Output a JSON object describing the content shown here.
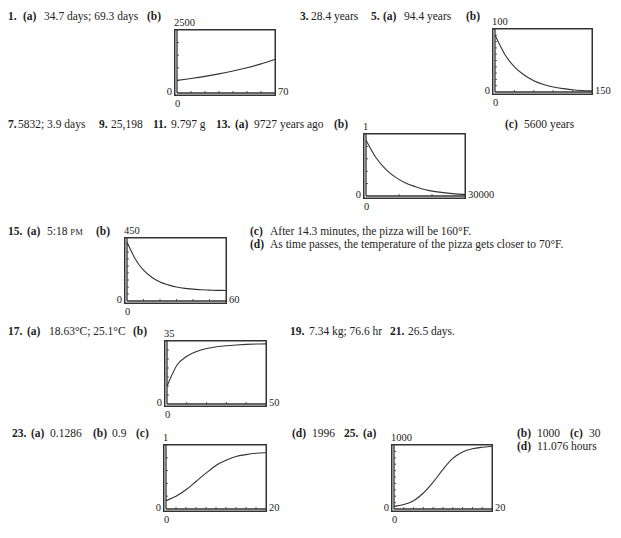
{
  "answers": {
    "a1": {
      "num": "1.",
      "a_lbl": "(a)",
      "a_val": "34.7 days; 69.3 days",
      "b_lbl": "(b)"
    },
    "a3": {
      "num": "3.",
      "val": "28.4 years"
    },
    "a5": {
      "num": "5.",
      "a_lbl": "(a)",
      "a_val": "94.4 years",
      "b_lbl": "(b)"
    },
    "a7": {
      "num": "7.",
      "val": "5832; 3.9 days"
    },
    "a9": {
      "num": "9.",
      "val": "25,198"
    },
    "a11": {
      "num": "11.",
      "val": "9.797 g"
    },
    "a13": {
      "num": "13.",
      "a_lbl": "(a)",
      "a_val": "9727 years ago",
      "b_lbl": "(b)",
      "c_lbl": "(c)",
      "c_val": "5600 years"
    },
    "a15": {
      "num": "15.",
      "a_lbl": "(a)",
      "a_val": "5:18",
      "a_suffix": "PM",
      "b_lbl": "(b)",
      "c_lbl": "(c)",
      "c_val": "After 14.3 minutes, the pizza will be 160°F.",
      "d_lbl": "(d)",
      "d_val": "As time passes, the temperature of the pizza gets closer to 70°F."
    },
    "a17": {
      "num": "17.",
      "a_lbl": "(a)",
      "a_val": "18.63°C; 25.1°C",
      "b_lbl": "(b)"
    },
    "a19": {
      "num": "19.",
      "val": "7.34 kg; 76.6 hr"
    },
    "a21": {
      "num": "21.",
      "val": "26.5 days."
    },
    "a23": {
      "num": "23.",
      "a_lbl": "(a)",
      "a_val": "0.1286",
      "b_lbl": "(b)",
      "b_val": "0.9",
      "c_lbl": "(c)",
      "d_lbl": "(d)",
      "d_val": "1996"
    },
    "a25": {
      "num": "25.",
      "a_lbl": "(a)",
      "b_lbl": "(b)",
      "b_val": "1000",
      "c_lbl": "(c)",
      "c_val": "30",
      "d_lbl": "(d)",
      "d_val": "11.076 hours"
    }
  },
  "chart_data": [
    {
      "id": "ex1b",
      "type": "line",
      "title": "",
      "xlabel": "",
      "ylabel": "",
      "xlim": [
        0,
        70
      ],
      "ylim": [
        0,
        2500
      ],
      "tick_labels": {
        "ymax": "2500",
        "ymin": "0",
        "xmin": "0",
        "xmax": "70"
      },
      "x": [
        0,
        10,
        20,
        30,
        40,
        50,
        60,
        70
      ],
      "y": [
        500,
        575,
        660,
        760,
        875,
        1005,
        1155,
        1330
      ],
      "grid": false,
      "x_ticks": 7,
      "y_ticks": 5
    },
    {
      "id": "ex5b",
      "type": "line",
      "title": "",
      "xlabel": "",
      "ylabel": "",
      "xlim": [
        0,
        150
      ],
      "ylim": [
        0,
        100
      ],
      "tick_labels": {
        "ymax": "100",
        "ymin": "0",
        "xmin": "0",
        "xmax": "150"
      },
      "x": [
        0,
        15,
        30,
        45,
        60,
        75,
        90,
        105,
        120,
        135,
        150
      ],
      "y": [
        90,
        60,
        40,
        27,
        18,
        12,
        8,
        5.4,
        3.6,
        2.4,
        1.6
      ],
      "grid": false,
      "x_ticks": 5,
      "y_ticks": 10
    },
    {
      "id": "ex13b",
      "type": "line",
      "title": "",
      "xlabel": "",
      "ylabel": "",
      "xlim": [
        0,
        30000
      ],
      "ylim": [
        0,
        1
      ],
      "tick_labels": {
        "ymax": "1",
        "ymin": "0",
        "xmin": "0",
        "xmax": "30000"
      },
      "x": [
        0,
        3000,
        6000,
        9000,
        12000,
        15000,
        18000,
        21000,
        24000,
        27000,
        30000
      ],
      "y": [
        0.9,
        0.62,
        0.43,
        0.3,
        0.21,
        0.15,
        0.1,
        0.07,
        0.05,
        0.035,
        0.025
      ],
      "grid": false,
      "x_ticks": 3,
      "y_ticks": 5
    },
    {
      "id": "ex15b",
      "type": "line",
      "title": "",
      "xlabel": "",
      "ylabel": "",
      "xlim": [
        0,
        60
      ],
      "ylim": [
        0,
        450
      ],
      "tick_labels": {
        "ymax": "450",
        "ymin": "0",
        "xmin": "0",
        "xmax": "60"
      },
      "x": [
        0,
        5,
        10,
        15,
        20,
        25,
        30,
        35,
        40,
        45,
        50,
        55,
        60
      ],
      "y": [
        420,
        300,
        220,
        170,
        135,
        115,
        100,
        90,
        85,
        80,
        78,
        76,
        75
      ],
      "grid": false,
      "x_ticks": 6,
      "y_ticks": 9
    },
    {
      "id": "ex17b",
      "type": "line",
      "title": "",
      "xlabel": "",
      "ylabel": "",
      "xlim": [
        0,
        50
      ],
      "ylim": [
        0,
        35
      ],
      "tick_labels": {
        "ymax": "35",
        "ymin": "0",
        "xmin": "0",
        "xmax": "50"
      },
      "x": [
        0,
        5,
        10,
        15,
        20,
        25,
        30,
        35,
        40,
        45,
        50
      ],
      "y": [
        10,
        21.5,
        26.5,
        29.2,
        30.8,
        31.8,
        32.4,
        32.8,
        33.1,
        33.3,
        33.4
      ],
      "grid": false,
      "x_ticks": 5,
      "y_ticks": 7
    },
    {
      "id": "ex23c",
      "type": "line",
      "title": "",
      "xlabel": "",
      "ylabel": "",
      "xlim": [
        0,
        20
      ],
      "ylim": [
        0,
        1
      ],
      "tick_labels": {
        "ymax": "1",
        "ymin": "0",
        "xmin": "0",
        "xmax": "20"
      },
      "x": [
        0,
        2,
        4,
        6,
        8,
        10,
        12,
        14,
        16,
        18,
        20
      ],
      "y": [
        0.13,
        0.2,
        0.3,
        0.43,
        0.56,
        0.68,
        0.76,
        0.82,
        0.85,
        0.87,
        0.88
      ],
      "grid": false,
      "x_ticks": 10,
      "y_ticks": 5
    },
    {
      "id": "ex25a",
      "type": "line",
      "title": "",
      "xlabel": "",
      "ylabel": "",
      "xlim": [
        0,
        20
      ],
      "ylim": [
        0,
        1000
      ],
      "tick_labels": {
        "ymax": "1000",
        "ymin": "0",
        "xmin": "0",
        "xmax": "20"
      },
      "x": [
        0,
        2,
        4,
        6,
        8,
        10,
        12,
        14,
        16,
        18,
        20
      ],
      "y": [
        40,
        70,
        130,
        250,
        420,
        620,
        790,
        890,
        940,
        965,
        980
      ],
      "grid": false,
      "x_ticks": 10,
      "y_ticks": 10
    }
  ]
}
